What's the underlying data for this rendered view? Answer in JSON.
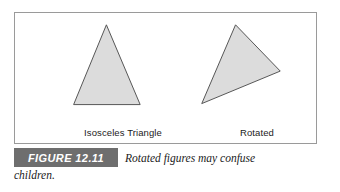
{
  "figure": {
    "number_label": "FIGURE 12.11",
    "caption_line1": "Rotated figures may confuse",
    "caption_line2": "children.",
    "bar_color": "#6e6e6e",
    "panel_border_color": "#9a9a9a",
    "shape_fill_color": "#dcdcdc",
    "shape_stroke_color": "#555555"
  },
  "shapes": [
    {
      "id": "isosceles-triangle",
      "label": "Isosceles Triangle",
      "type": "polygon",
      "points": "92,12 59,93 126,93"
    },
    {
      "id": "rotated-triangle",
      "label": "Rotated",
      "type": "polygon",
      "points": "222,12 267,59 188,92"
    }
  ]
}
